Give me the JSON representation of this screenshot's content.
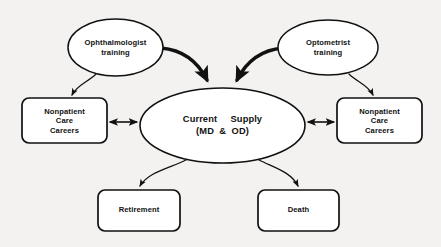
{
  "diagram": {
    "background_color": "#f3f2f0",
    "stroke_color": "#111111",
    "fill_color": "#ffffff",
    "nodes": {
      "ophthalmologist_training": {
        "shape": "ellipse",
        "line1": "Ophthalmologist",
        "line2": "training"
      },
      "optometrist_training": {
        "shape": "ellipse",
        "line1": "Optometrist",
        "line2": "training"
      },
      "current_supply": {
        "shape": "ellipse",
        "line1_left": "Current",
        "line1_right": "Supply",
        "line2_left": "(MD",
        "line2_mid": "&",
        "line2_right": "OD)"
      },
      "nonpatient_left": {
        "shape": "rounded-rect",
        "line1": "Nonpatient",
        "line2": "Care",
        "line3": "Careers"
      },
      "nonpatient_right": {
        "shape": "rounded-rect",
        "line1": "Nonpatient",
        "line2": "Care",
        "line3": "Careers"
      },
      "retirement": {
        "shape": "rounded-rect",
        "line1": "Retirement"
      },
      "death": {
        "shape": "rounded-rect",
        "line1": "Death"
      }
    },
    "edges": [
      {
        "name": "ophthalmologist-to-supply",
        "from": "ophthalmologist_training",
        "to": "current_supply",
        "style": "thick-curved",
        "arrowheads": "single"
      },
      {
        "name": "optometrist-to-supply",
        "from": "optometrist_training",
        "to": "current_supply",
        "style": "thick-curved",
        "arrowheads": "single"
      },
      {
        "name": "ophthalmologist-to-nonpatient-left",
        "from": "ophthalmologist_training",
        "to": "nonpatient_left",
        "style": "thin-curved",
        "arrowheads": "single"
      },
      {
        "name": "optometrist-to-nonpatient-right",
        "from": "optometrist_training",
        "to": "nonpatient_right",
        "style": "thin-curved",
        "arrowheads": "single"
      },
      {
        "name": "supply-to-nonpatient-left",
        "from": "current_supply",
        "to": "nonpatient_left",
        "style": "straight",
        "arrowheads": "double"
      },
      {
        "name": "supply-to-nonpatient-right",
        "from": "current_supply",
        "to": "nonpatient_right",
        "style": "straight",
        "arrowheads": "double"
      },
      {
        "name": "supply-to-retirement",
        "from": "current_supply",
        "to": "retirement",
        "style": "thin-curved",
        "arrowheads": "single"
      },
      {
        "name": "supply-to-death",
        "from": "current_supply",
        "to": "death",
        "style": "thin-curved",
        "arrowheads": "single"
      }
    ]
  }
}
